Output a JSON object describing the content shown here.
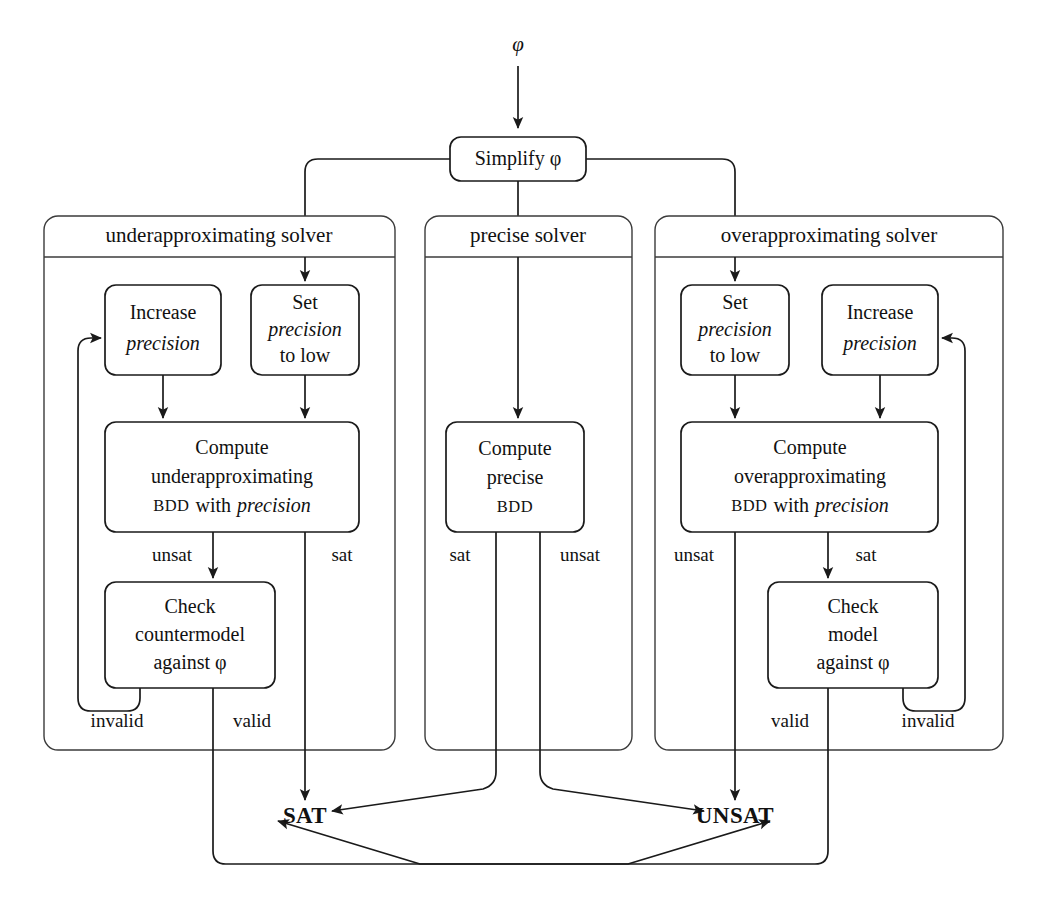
{
  "diagram": {
    "input_label": "φ",
    "root": {
      "label": "Simplify φ"
    },
    "terminals": {
      "sat": "SAT",
      "unsat": "UNSAT"
    },
    "panels": [
      {
        "id": "under",
        "title": "underapproximating solver",
        "nodes": [
          {
            "id": "u-increase",
            "line1": "Increase",
            "line2": "precision"
          },
          {
            "id": "u-set",
            "line1": "Set",
            "line2": "precision",
            "line3": "to low"
          },
          {
            "id": "u-compute",
            "line1": "Compute",
            "line2": "underapproximating",
            "line3a": "BDD",
            "line3b": "with",
            "line3c": "precision"
          },
          {
            "id": "u-check",
            "line1": "Check",
            "line2": "countermodel",
            "line3": "against φ"
          }
        ],
        "edge_labels": {
          "unsat": "unsat",
          "sat": "sat",
          "invalid": "invalid",
          "valid": "valid"
        }
      },
      {
        "id": "precise",
        "title": "precise solver",
        "nodes": [
          {
            "id": "p-compute",
            "line1": "Compute",
            "line2": "precise",
            "line3": "BDD"
          }
        ],
        "edge_labels": {
          "sat": "sat",
          "unsat": "unsat"
        }
      },
      {
        "id": "over",
        "title": "overapproximating solver",
        "nodes": [
          {
            "id": "o-set",
            "line1": "Set",
            "line2": "precision",
            "line3": "to low"
          },
          {
            "id": "o-increase",
            "line1": "Increase",
            "line2": "precision"
          },
          {
            "id": "o-compute",
            "line1": "Compute",
            "line2": "overapproximating",
            "line3a": "BDD",
            "line3b": "with",
            "line3c": "precision"
          },
          {
            "id": "o-check",
            "line1": "Check",
            "line2": "model",
            "line3": "against φ"
          }
        ],
        "edge_labels": {
          "unsat": "unsat",
          "sat": "sat",
          "valid": "valid",
          "invalid": "invalid"
        }
      }
    ],
    "colors": {
      "ink": "#1a1a1a",
      "panel_stroke": "#3b3b3b",
      "background": "#ffffff"
    }
  }
}
